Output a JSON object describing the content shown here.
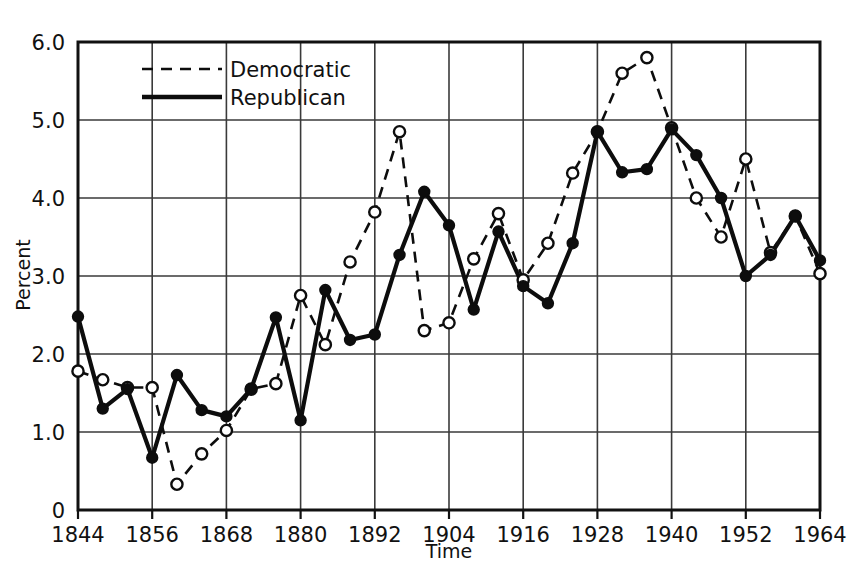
{
  "chart_data": {
    "type": "line",
    "title": "",
    "xlabel": "Time",
    "ylabel": "Percent",
    "xlim": [
      1844,
      1964
    ],
    "ylim": [
      0,
      6.0
    ],
    "xticks": [
      "1844",
      "1856",
      "1868",
      "1880",
      "1892",
      "1904",
      "1916",
      "1928",
      "1940",
      "1952",
      "1964"
    ],
    "xtick_values": [
      1844,
      1856,
      1868,
      1880,
      1892,
      1904,
      1916,
      1928,
      1940,
      1952,
      1964
    ],
    "yticks": [
      "0",
      "1.0",
      "2.0",
      "3.0",
      "4.0",
      "5.0",
      "6.0"
    ],
    "ytick_values": [
      0,
      1.0,
      2.0,
      3.0,
      4.0,
      5.0,
      6.0
    ],
    "grid": true,
    "legend_position": "top-left-inside",
    "x": [
      1844,
      1848,
      1852,
      1856,
      1860,
      1864,
      1868,
      1872,
      1876,
      1880,
      1884,
      1888,
      1892,
      1896,
      1900,
      1904,
      1908,
      1912,
      1916,
      1920,
      1924,
      1928,
      1932,
      1936,
      1940,
      1944,
      1948,
      1952,
      1956,
      1960,
      1964
    ],
    "series": [
      {
        "name": "Democratic",
        "style": "dashed",
        "marker": "open-circle",
        "values": [
          1.78,
          1.67,
          1.57,
          1.57,
          0.33,
          0.72,
          1.02,
          1.55,
          1.62,
          2.75,
          2.12,
          3.18,
          3.82,
          4.85,
          2.3,
          2.4,
          3.22,
          3.8,
          2.95,
          3.42,
          4.32,
          4.85,
          5.6,
          5.8,
          4.9,
          4.0,
          3.5,
          4.5,
          3.3,
          3.77,
          3.03
        ]
      },
      {
        "name": "Republican",
        "style": "solid",
        "marker": "filled-circle",
        "values": [
          2.48,
          1.3,
          1.55,
          0.67,
          1.73,
          1.28,
          1.2,
          1.55,
          2.47,
          1.15,
          2.82,
          2.18,
          2.25,
          3.27,
          4.08,
          3.65,
          2.57,
          3.57,
          2.87,
          2.65,
          3.42,
          4.85,
          4.33,
          4.37,
          4.88,
          4.55,
          4.0,
          3.0,
          3.27,
          3.77,
          3.2
        ]
      }
    ]
  },
  "legend": {
    "items": [
      {
        "label": "Democratic",
        "style": "dashed"
      },
      {
        "label": "Republican",
        "style": "solid"
      }
    ]
  },
  "axes": {
    "y_title": "Percent",
    "x_title": "Time"
  }
}
